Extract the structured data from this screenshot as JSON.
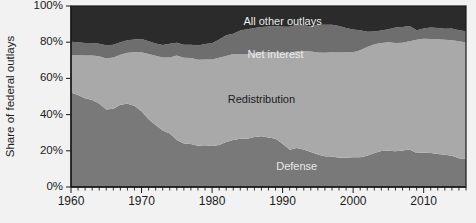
{
  "chart_data": {
    "type": "area",
    "stacked": true,
    "title": "",
    "xlabel": "",
    "ylabel": "Share of federal outlays",
    "xlim": [
      1960,
      2016
    ],
    "ylim": [
      0,
      100
    ],
    "grid": false,
    "legend_position": "inline-annotations",
    "y_ticks": [
      0,
      20,
      40,
      60,
      80,
      100
    ],
    "y_tick_labels": [
      "0%",
      "20%",
      "40%",
      "60%",
      "80%",
      "100%"
    ],
    "x_ticks": [
      1960,
      1970,
      1980,
      1990,
      2000,
      2010
    ],
    "x_tick_labels": [
      "1960",
      "1970",
      "1980",
      "1990",
      "2000",
      "2010"
    ],
    "x_minor_tick_interval": 1,
    "x": [
      1960,
      1961,
      1962,
      1963,
      1964,
      1965,
      1966,
      1967,
      1968,
      1969,
      1970,
      1971,
      1972,
      1973,
      1974,
      1975,
      1976,
      1977,
      1978,
      1979,
      1980,
      1981,
      1982,
      1983,
      1984,
      1985,
      1986,
      1987,
      1988,
      1989,
      1990,
      1991,
      1992,
      1993,
      1994,
      1995,
      1996,
      1997,
      1998,
      1999,
      2000,
      2001,
      2002,
      2003,
      2004,
      2005,
      2006,
      2007,
      2008,
      2009,
      2010,
      2011,
      2012,
      2013,
      2014,
      2015,
      2016
    ],
    "series": [
      {
        "name": "Defense",
        "color": "#797979",
        "label_color": "#e9e9e9",
        "label_x": 1992,
        "label_y": 11,
        "values": [
          52.2,
          50.8,
          49.0,
          48.0,
          46.2,
          42.8,
          43.2,
          45.4,
          46.0,
          44.9,
          41.8,
          37.5,
          34.3,
          31.2,
          29.5,
          26.0,
          24.1,
          23.8,
          22.8,
          23.1,
          22.7,
          23.2,
          24.8,
          26.0,
          26.7,
          26.7,
          27.6,
          28.1,
          27.3,
          26.6,
          23.9,
          20.6,
          21.6,
          20.7,
          19.3,
          17.9,
          17.0,
          16.9,
          16.2,
          16.2,
          16.5,
          16.4,
          17.3,
          18.8,
          19.9,
          20.0,
          19.7,
          20.2,
          20.7,
          18.8,
          19.1,
          18.8,
          18.2,
          17.8,
          17.2,
          15.9,
          15.3
        ]
      },
      {
        "name": "Redistribution",
        "color": "#a9a9a9",
        "label_color": "#1c1c1c",
        "label_x": 1987,
        "label_y": 48,
        "values": [
          20.6,
          22.0,
          23.6,
          24.6,
          26.0,
          28.2,
          28.3,
          27.7,
          28.2,
          29.6,
          32.6,
          36.0,
          38.2,
          40.3,
          42.0,
          46.6,
          47.3,
          47.5,
          47.5,
          47.3,
          47.8,
          48.2,
          47.6,
          47.5,
          46.8,
          46.8,
          46.5,
          46.5,
          47.1,
          47.6,
          49.9,
          53.2,
          53.6,
          54.5,
          55.5,
          56.4,
          57.2,
          57.6,
          58.1,
          58.2,
          58.0,
          59.1,
          60.0,
          60.0,
          59.6,
          60.0,
          59.9,
          59.5,
          59.8,
          62.5,
          62.8,
          62.9,
          63.4,
          63.5,
          63.9,
          64.6,
          64.6
        ]
      },
      {
        "name": "Net interest",
        "color": "#6e6e6e",
        "label_color": "#ececec",
        "label_x": 1989,
        "label_y": 73,
        "values": [
          7.5,
          7.2,
          6.9,
          7.0,
          7.0,
          7.3,
          7.1,
          6.9,
          6.9,
          7.0,
          7.4,
          7.0,
          6.8,
          7.0,
          7.7,
          7.1,
          7.2,
          7.3,
          7.9,
          8.6,
          8.9,
          10.1,
          11.4,
          11.1,
          13.0,
          13.7,
          13.7,
          13.8,
          14.3,
          14.8,
          14.7,
          14.7,
          14.4,
          14.1,
          13.9,
          15.3,
          15.5,
          15.2,
          14.6,
          13.5,
          12.5,
          11.1,
          8.5,
          7.1,
          7.0,
          7.2,
          8.5,
          8.7,
          8.5,
          5.3,
          5.7,
          6.4,
          6.2,
          6.2,
          6.5,
          6.1,
          6.2
        ]
      },
      {
        "name": "All other outlays",
        "color": "#2b2b2b",
        "label_color": "#ececec",
        "label_x": 1990,
        "label_y": 91,
        "values": [
          19.7,
          20.0,
          20.5,
          20.4,
          20.8,
          21.7,
          21.4,
          20.0,
          18.9,
          18.5,
          18.2,
          19.5,
          20.7,
          21.5,
          20.8,
          20.3,
          21.4,
          21.4,
          21.8,
          21.0,
          20.6,
          18.5,
          16.2,
          15.4,
          13.5,
          12.8,
          12.2,
          11.6,
          11.3,
          11.0,
          11.5,
          11.5,
          10.4,
          10.7,
          11.3,
          10.4,
          10.3,
          10.3,
          11.1,
          12.1,
          13.0,
          13.4,
          14.2,
          14.1,
          13.5,
          12.8,
          11.9,
          11.6,
          11.0,
          13.4,
          12.4,
          11.9,
          12.2,
          12.5,
          12.4,
          13.4,
          13.9
        ]
      }
    ]
  },
  "figure": {
    "background_color": "#f2f2f2",
    "axis_color": "#1a1a1a",
    "plot_left_px": 71,
    "plot_right_px": 466,
    "plot_top_px": 6,
    "plot_bottom_px": 187
  }
}
